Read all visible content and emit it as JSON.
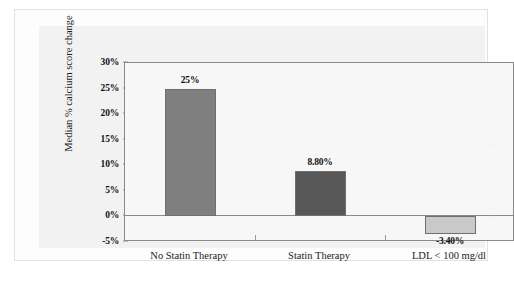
{
  "chart_data": {
    "type": "bar",
    "title": "",
    "xlabel": "",
    "ylabel": "Median % calcium score change",
    "categories": [
      "No Statin Therapy",
      "Statin Therapy",
      "LDL < 100 mg/dl"
    ],
    "values": [
      25,
      8.8,
      -3.4
    ],
    "data_labels": [
      "25%",
      "8.80%",
      "-3.40%"
    ],
    "bar_colors": [
      "#7f7f7f",
      "#585858",
      "#c9c9c9"
    ],
    "ylim": [
      -5,
      30
    ],
    "ytick_values": [
      30,
      25,
      20,
      15,
      10,
      5,
      0,
      -5
    ],
    "ytick_labels": [
      "30%",
      "25%",
      "20%",
      "15%",
      "10%",
      "5%",
      "0%",
      "-5%"
    ],
    "grid": false,
    "legend": "none",
    "zero_line": true
  },
  "figure": {
    "background": "#f2f2f2",
    "plot_background": "#f7f7f7",
    "frame_color": "#8b8b8b"
  },
  "bleed_text": {
    "lines": [
      "•",
      "•",
      "•",
      "•",
      "•",
      "•",
      "•",
      "•",
      "•",
      "•",
      "•",
      "•",
      "•",
      "•"
    ]
  }
}
